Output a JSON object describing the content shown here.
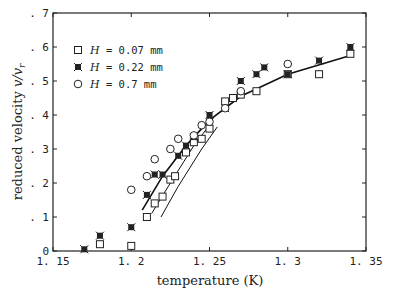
{
  "chart_data": {
    "type": "scatter",
    "title": "",
    "xlabel": "temperature (K)",
    "ylabel": "reduced velocity v/v_r",
    "xlim": [
      1.15,
      1.35
    ],
    "ylim": [
      0,
      0.7
    ],
    "xticks": [
      "1.15",
      "1.2",
      "1.25",
      "1.3",
      "1.35"
    ],
    "yticks": [
      "0",
      ".1",
      ".2",
      ".3",
      ".4",
      ".5",
      ".6",
      ".7"
    ],
    "grid": false,
    "legend_position": "upper left",
    "series": [
      {
        "name": "H = 0.07 mm",
        "marker": "square-open",
        "x": [
          1.18,
          1.2,
          1.21,
          1.215,
          1.22,
          1.225,
          1.228,
          1.235,
          1.24,
          1.245,
          1.25,
          1.26,
          1.265,
          1.27,
          1.28,
          1.3,
          1.32,
          1.34
        ],
        "y": [
          0.02,
          0.015,
          0.1,
          0.14,
          0.16,
          0.21,
          0.22,
          0.29,
          0.32,
          0.33,
          0.36,
          0.44,
          0.45,
          0.46,
          0.47,
          0.52,
          0.52,
          0.58
        ]
      },
      {
        "name": "H = 0.22 mm",
        "marker": "star-filled",
        "x": [
          1.17,
          1.18,
          1.2,
          1.21,
          1.215,
          1.22,
          1.23,
          1.235,
          1.24,
          1.25,
          1.26,
          1.27,
          1.28,
          1.285,
          1.3,
          1.32,
          1.34
        ],
        "y": [
          0.005,
          0.045,
          0.07,
          0.165,
          0.225,
          0.225,
          0.28,
          0.31,
          0.335,
          0.4,
          0.42,
          0.5,
          0.52,
          0.54,
          0.52,
          0.56,
          0.6
        ]
      },
      {
        "name": "H = 0.7 mm",
        "marker": "circle-open",
        "x": [
          1.2,
          1.21,
          1.215,
          1.225,
          1.23,
          1.24,
          1.245,
          1.25,
          1.26,
          1.27,
          1.3
        ],
        "y": [
          0.18,
          0.22,
          0.27,
          0.3,
          0.33,
          0.34,
          0.37,
          0.38,
          0.42,
          0.47,
          0.55
        ]
      }
    ],
    "fit_curves": [
      {
        "name": "fit H=0.7",
        "x": [
          1.207,
          1.22,
          1.235,
          1.25,
          1.27,
          1.3,
          1.34
        ],
        "y": [
          0.12,
          0.22,
          0.31,
          0.385,
          0.455,
          0.52,
          0.575
        ]
      },
      {
        "name": "fit H=0.22",
        "x": [
          1.213,
          1.225,
          1.24,
          1.25
        ],
        "y": [
          0.11,
          0.2,
          0.31,
          0.37
        ]
      },
      {
        "name": "fit H=0.07",
        "x": [
          1.219,
          1.23,
          1.245,
          1.255
        ],
        "y": [
          0.1,
          0.19,
          0.3,
          0.365
        ]
      }
    ]
  },
  "legend": [
    {
      "symbol": "□",
      "var": "H",
      "text": " = 0.07  mm"
    },
    {
      "symbol": "✱",
      "var": "H",
      "text": " = 0.22  mm"
    },
    {
      "symbol": "○",
      "var": "H",
      "text": " = 0.7  mm"
    }
  ],
  "labels": {
    "xlabel": "temperature (K)",
    "ylabel_text": "reduced velocity ",
    "ylabel_var": "v/v",
    "ylabel_sub": "r"
  }
}
